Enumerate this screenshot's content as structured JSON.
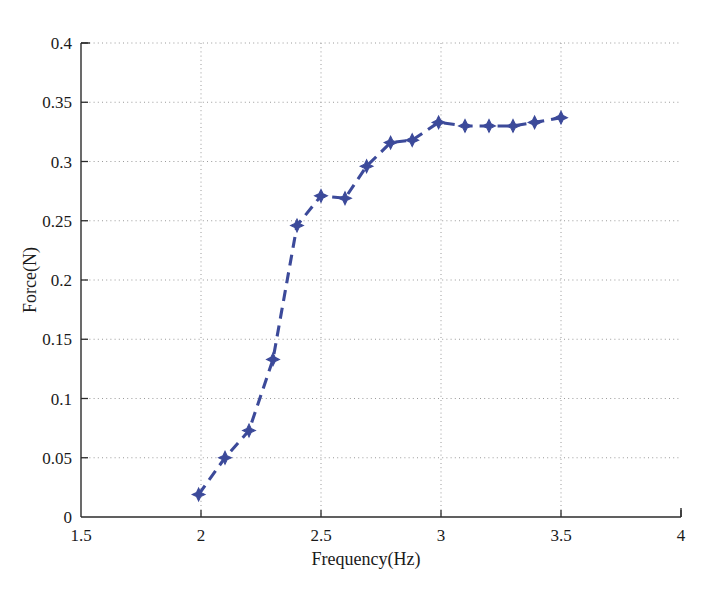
{
  "chart_data": {
    "type": "line",
    "title": "",
    "subtitle": "",
    "xlabel": "Frequency(Hz)",
    "ylabel": "Force(N)",
    "xlim": [
      1.5,
      4
    ],
    "ylim": [
      0,
      0.4
    ],
    "grid": true,
    "legend_position": "none",
    "line_style": "dashed",
    "marker": "diamond",
    "series_color": "#3c4a9a",
    "xticks": [
      1.5,
      2,
      2.5,
      3,
      3.5,
      4
    ],
    "xtick_labels": [
      "1.5",
      "2",
      "2.5",
      "3",
      "3.5",
      "4"
    ],
    "yticks": [
      0,
      0.05,
      0.1,
      0.15,
      0.2,
      0.25,
      0.3,
      0.35,
      0.4
    ],
    "ytick_labels": [
      "0",
      "0.05",
      "0.1",
      "0.15",
      "0.2",
      "0.25",
      "0.3",
      "0.35",
      "0.4"
    ],
    "series": [
      {
        "name": "Force vs Frequency",
        "x": [
          1.99,
          2.1,
          2.2,
          2.3,
          2.4,
          2.5,
          2.6,
          2.69,
          2.79,
          2.88,
          2.99,
          3.1,
          3.2,
          3.3,
          3.39,
          3.5
        ],
        "values": [
          0.019,
          0.05,
          0.073,
          0.133,
          0.246,
          0.271,
          0.269,
          0.296,
          0.316,
          0.318,
          0.333,
          0.33,
          0.33,
          0.33,
          0.333,
          0.337
        ]
      }
    ],
    "points": [
      {
        "x": 1.99,
        "y": 0.019
      },
      {
        "x": 2.1,
        "y": 0.05
      },
      {
        "x": 2.2,
        "y": 0.073
      },
      {
        "x": 2.3,
        "y": 0.133
      },
      {
        "x": 2.4,
        "y": 0.246
      },
      {
        "x": 2.5,
        "y": 0.271
      },
      {
        "x": 2.6,
        "y": 0.269
      },
      {
        "x": 2.69,
        "y": 0.296
      },
      {
        "x": 2.79,
        "y": 0.316
      },
      {
        "x": 2.88,
        "y": 0.318
      },
      {
        "x": 2.99,
        "y": 0.333
      },
      {
        "x": 3.1,
        "y": 0.33
      },
      {
        "x": 3.2,
        "y": 0.33
      },
      {
        "x": 3.3,
        "y": 0.33
      },
      {
        "x": 3.39,
        "y": 0.333
      },
      {
        "x": 3.5,
        "y": 0.337
      }
    ]
  }
}
